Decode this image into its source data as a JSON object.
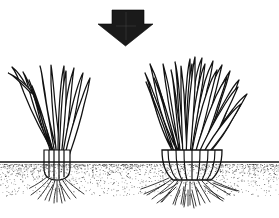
{
  "figure": {
    "canvas": {
      "width": 279,
      "height": 218
    },
    "colors": {
      "background": "#ffffff",
      "ink": "#111111",
      "arrow_fill": "#1a1a1a",
      "soil_stipple": "#2b2b2b",
      "root": "#1a1a1a"
    }
  },
  "arrow": {
    "name": "downward arrow",
    "direction": "down",
    "fill": "#1a1a1a",
    "bounds": {
      "x": 98,
      "y": 10,
      "width": 55,
      "height": 36
    },
    "shaft": {
      "x": 112,
      "y": 10,
      "width": 32,
      "height": 14
    },
    "tip_y": 46
  },
  "soil": {
    "name": "soil horizon",
    "line_y": 162,
    "line_x_start": 0,
    "line_x_end": 279,
    "stipple_top": 164,
    "stipple_bottom": 196,
    "stipple_density": 2100
  },
  "plants": [
    {
      "id": "left-clump",
      "name": "sparse grass clump",
      "label": "before",
      "density": "sparse",
      "blade_count": 11,
      "center_x": 57,
      "crown": {
        "x": 42,
        "y": 150,
        "width": 30,
        "height": 28
      },
      "top_y": 62,
      "spread_x": [
        12,
        92
      ],
      "root_spread": {
        "x": 30,
        "y": 178,
        "width": 56,
        "height": 26
      },
      "root_count": 12
    },
    {
      "id": "right-clump",
      "name": "dense grass clump",
      "label": "after",
      "density": "dense",
      "blade_count": 22,
      "center_x": 192,
      "crown": {
        "x": 159,
        "y": 150,
        "width": 58,
        "height": 30
      },
      "top_y": 55,
      "spread_x": [
        148,
        248
      ],
      "root_spread": {
        "x": 152,
        "y": 178,
        "width": 100,
        "height": 34
      },
      "root_count": 26
    }
  ]
}
